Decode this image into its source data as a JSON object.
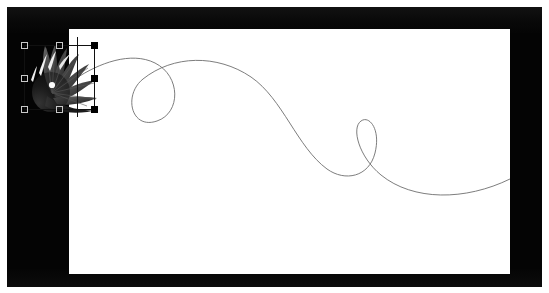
{
  "app": {
    "title": "Vector Editor Canvas",
    "workspace_background": "#040404",
    "artboard_background": "#ffffff"
  },
  "artboard": {
    "name": "page",
    "x": 62,
    "y": 22,
    "width": 441,
    "height": 245
  },
  "objects": [
    {
      "name": "butterfly-wing-graphic",
      "type": "raster-image",
      "selected": true,
      "x": 14,
      "y": 33,
      "width": 78,
      "height": 74,
      "description": "grayscale fan-shaped butterfly wing with radiating veins and light spots"
    },
    {
      "name": "spiral-swash-path",
      "type": "bezier-path",
      "selected": false,
      "stroke_color": "#6e6e6e",
      "stroke_width": 0.9,
      "fill": "none",
      "description": "long flowing swash with two loops travelling left to right across the page"
    }
  ],
  "selection": {
    "name": "transform-box",
    "stroke_color": "#111111",
    "bounds": {
      "left": 17,
      "top": 38,
      "right": 87,
      "bottom": 102
    },
    "handles": [
      {
        "name": "handle-top-left",
        "x": 14,
        "y": 35,
        "style": "hollow"
      },
      {
        "name": "handle-top-center",
        "x": 49,
        "y": 35,
        "style": "hollow"
      },
      {
        "name": "handle-top-right",
        "x": 84,
        "y": 35,
        "style": "filled"
      },
      {
        "name": "handle-middle-left",
        "x": 14,
        "y": 68,
        "style": "hollow"
      },
      {
        "name": "handle-middle-right",
        "x": 84,
        "y": 68,
        "style": "filled"
      },
      {
        "name": "handle-bottom-left",
        "x": 14,
        "y": 99,
        "style": "hollow"
      },
      {
        "name": "handle-bottom-center",
        "x": 49,
        "y": 99,
        "style": "hollow"
      },
      {
        "name": "handle-bottom-right",
        "x": 84,
        "y": 99,
        "style": "filled"
      }
    ]
  },
  "path_geometry": {
    "stroke": "#6e6e6e",
    "stroke_width": 0.9,
    "d": "M 6 50 C 30 34, 62 22, 86 34 C 112 47, 112 84, 88 92 C 62 101, 54 66, 74 50 C 104 26, 148 25, 182 48 C 214 70, 228 118, 258 140 C 276 153, 300 148, 306 124 C 312 100, 300 86, 292 92 C 282 99, 290 128, 312 146 C 344 172, 396 172, 441 150"
  },
  "butterfly_geometry": {
    "base_color": "#151515",
    "vein_color": "#4a4a4a",
    "highlight_color": "#f2f2f2",
    "spot_color": "#fafafa",
    "wing_count": 7
  }
}
